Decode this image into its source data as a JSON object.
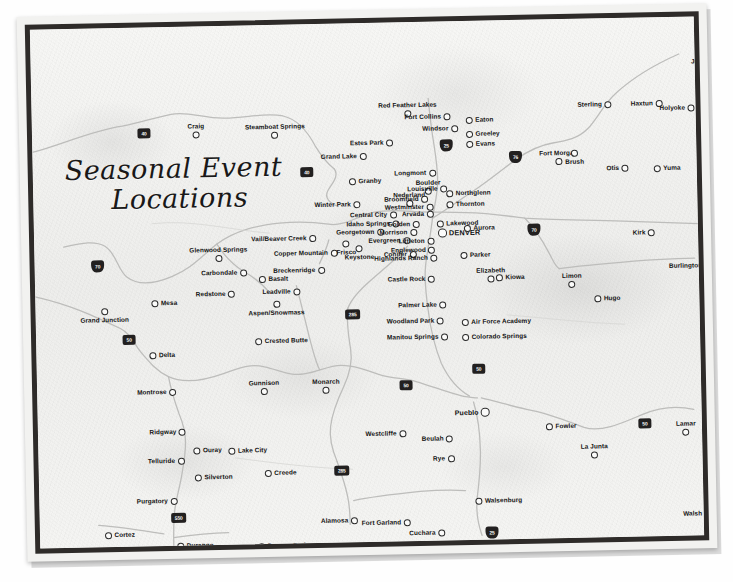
{
  "map": {
    "title_line1": "Seasonal Event",
    "title_line2": "Locations",
    "region": "Colorado",
    "colors": {
      "frame": "#2e2b29",
      "paper": "#f4f4f2",
      "road": "#b8b8b6",
      "marker_outline": "#2b2b2b",
      "label": "#121212",
      "shield": "#222020"
    },
    "cities": [
      {
        "name": "Craig",
        "x": 164,
        "y": 97,
        "anchor": "above"
      },
      {
        "name": "Steamboat Springs",
        "x": 243,
        "y": 99,
        "anchor": "above"
      },
      {
        "name": "Red Feather Lakes",
        "x": 376,
        "y": 80,
        "anchor": "above"
      },
      {
        "name": "Fort Collins",
        "x": 419,
        "y": 92,
        "anchor": "rl"
      },
      {
        "name": "Windsor",
        "x": 426,
        "y": 104,
        "anchor": "rl"
      },
      {
        "name": "Eaton",
        "x": 434,
        "y": 96,
        "anchor": "lr"
      },
      {
        "name": "Greeley",
        "x": 434,
        "y": 110,
        "anchor": "lr"
      },
      {
        "name": "Evans",
        "x": 434,
        "y": 120,
        "anchor": "lr"
      },
      {
        "name": "Fort Morgan",
        "x": 526,
        "y": 131,
        "anchor": "above"
      },
      {
        "name": "Brush",
        "x": 542,
        "y": 131,
        "anchor": "below"
      },
      {
        "name": "Sterling",
        "x": 580,
        "y": 83,
        "anchor": "rl"
      },
      {
        "name": "Julesburg",
        "x": 676,
        "y": 42,
        "anchor": "above"
      },
      {
        "name": "Haxtun",
        "x": 631,
        "y": 83,
        "anchor": "rl"
      },
      {
        "name": "Holyoke",
        "x": 663,
        "y": 88,
        "anchor": "rl"
      },
      {
        "name": "Otis",
        "x": 596,
        "y": 147,
        "anchor": "rl"
      },
      {
        "name": "Yuma",
        "x": 621,
        "y": 148,
        "anchor": "lr"
      },
      {
        "name": "Estes Park",
        "x": 361,
        "y": 117,
        "anchor": "rl"
      },
      {
        "name": "Grand Lake",
        "x": 334,
        "y": 130,
        "anchor": "rl"
      },
      {
        "name": "Granby",
        "x": 316,
        "y": 155,
        "anchor": "lr"
      },
      {
        "name": "Longmont",
        "x": 403,
        "y": 148,
        "anchor": "rl"
      },
      {
        "name": "Boulder",
        "x": 395,
        "y": 158,
        "anchor": "above"
      },
      {
        "name": "Louisville",
        "x": 414,
        "y": 164,
        "anchor": "rl"
      },
      {
        "name": "Nederland",
        "x": 376,
        "y": 170,
        "anchor": "above"
      },
      {
        "name": "Northglenn",
        "x": 413,
        "y": 169,
        "anchor": "lr"
      },
      {
        "name": "Broomfield",
        "x": 395,
        "y": 174,
        "anchor": "rl"
      },
      {
        "name": "Thornton",
        "x": 413,
        "y": 180,
        "anchor": "lr"
      },
      {
        "name": "Westminster",
        "x": 400,
        "y": 182,
        "anchor": "rl"
      },
      {
        "name": "Arvada",
        "x": 400,
        "y": 189,
        "anchor": "rl"
      },
      {
        "name": "Winter Park",
        "x": 327,
        "y": 178,
        "anchor": "rl"
      },
      {
        "name": "Central City",
        "x": 363,
        "y": 189,
        "anchor": "rl"
      },
      {
        "name": "Idaho Springs",
        "x": 366,
        "y": 198,
        "anchor": "rl"
      },
      {
        "name": "Golden",
        "x": 386,
        "y": 199,
        "anchor": "rl"
      },
      {
        "name": "Lakewood",
        "x": 403,
        "y": 199,
        "anchor": "lr"
      },
      {
        "name": "DENVER",
        "x": 404,
        "y": 207,
        "anchor": "lr",
        "class": "capital"
      },
      {
        "name": "Aurora",
        "x": 430,
        "y": 204,
        "anchor": "lr"
      },
      {
        "name": "Georgetown",
        "x": 350,
        "y": 206,
        "anchor": "rl"
      },
      {
        "name": "Morrison",
        "x": 383,
        "y": 207,
        "anchor": "rl"
      },
      {
        "name": "Evergreen",
        "x": 376,
        "y": 215,
        "anchor": "rl"
      },
      {
        "name": "Littleton",
        "x": 400,
        "y": 216,
        "anchor": "rl"
      },
      {
        "name": "Englewood",
        "x": 401,
        "y": 225,
        "anchor": "rl"
      },
      {
        "name": "Conifer",
        "x": 382,
        "y": 229,
        "anchor": "rl"
      },
      {
        "name": "Highlands Ranch",
        "x": 403,
        "y": 233,
        "anchor": "rl"
      },
      {
        "name": "Parker",
        "x": 426,
        "y": 231,
        "anchor": "lr"
      },
      {
        "name": "Castle Rock",
        "x": 400,
        "y": 254,
        "anchor": "rl"
      },
      {
        "name": "Elizabeth",
        "x": 456,
        "y": 247,
        "anchor": "above"
      },
      {
        "name": "Kiowa",
        "x": 461,
        "y": 254,
        "anchor": "lr"
      },
      {
        "name": "Limon",
        "x": 537,
        "y": 254,
        "anchor": "above"
      },
      {
        "name": "Hugo",
        "x": 559,
        "y": 277,
        "anchor": "lr"
      },
      {
        "name": "Burlington",
        "x": 677,
        "y": 246,
        "anchor": "rl"
      },
      {
        "name": "Kirk",
        "x": 621,
        "y": 212,
        "anchor": "rl"
      },
      {
        "name": "Glenwood Springs",
        "x": 184,
        "y": 221,
        "anchor": "above"
      },
      {
        "name": "Vail/Beaver Creek",
        "x": 282,
        "y": 211,
        "anchor": "rl"
      },
      {
        "name": "Copper Mountain",
        "x": 303,
        "y": 226,
        "anchor": "rl"
      },
      {
        "name": "Frisco",
        "x": 312,
        "y": 217,
        "anchor": "below"
      },
      {
        "name": "Keystone",
        "x": 325,
        "y": 222,
        "anchor": "below"
      },
      {
        "name": "Breckenridge",
        "x": 290,
        "y": 243,
        "anchor": "rl"
      },
      {
        "name": "Carbondale",
        "x": 212,
        "y": 244,
        "anchor": "rl"
      },
      {
        "name": "Basalt",
        "x": 224,
        "y": 251,
        "anchor": "lr"
      },
      {
        "name": "Redstone",
        "x": 200,
        "y": 265,
        "anchor": "rl"
      },
      {
        "name": "Aspen/Snowmass",
        "x": 241,
        "y": 276,
        "anchor": "below"
      },
      {
        "name": "Leadville",
        "x": 265,
        "y": 264,
        "anchor": "rl"
      },
      {
        "name": "Mesa",
        "x": 116,
        "y": 273,
        "anchor": "lr"
      },
      {
        "name": "Grand Junction",
        "x": 69,
        "y": 280,
        "anchor": "below"
      },
      {
        "name": "Delta",
        "x": 113,
        "y": 325,
        "anchor": "lr"
      },
      {
        "name": "Crested Butte",
        "x": 219,
        "y": 313,
        "anchor": "lr"
      },
      {
        "name": "Gunnison",
        "x": 227,
        "y": 355,
        "anchor": "above"
      },
      {
        "name": "Monarch",
        "x": 289,
        "y": 355,
        "anchor": "above"
      },
      {
        "name": "Montrose",
        "x": 139,
        "y": 362,
        "anchor": "rl"
      },
      {
        "name": "Ridgway",
        "x": 148,
        "y": 402,
        "anchor": "rl"
      },
      {
        "name": "Ouray",
        "x": 155,
        "y": 421,
        "anchor": "lr"
      },
      {
        "name": "Lake City",
        "x": 190,
        "y": 422,
        "anchor": "lr"
      },
      {
        "name": "Telluride",
        "x": 146,
        "y": 431,
        "anchor": "rl"
      },
      {
        "name": "Silverton",
        "x": 156,
        "y": 448,
        "anchor": "lr"
      },
      {
        "name": "Creede",
        "x": 226,
        "y": 445,
        "anchor": "lr"
      },
      {
        "name": "Purgatory",
        "x": 138,
        "y": 471,
        "anchor": "rl"
      },
      {
        "name": "Cortez",
        "x": 65,
        "y": 504,
        "anchor": "lr"
      },
      {
        "name": "Durango",
        "x": 137,
        "y": 516,
        "anchor": "lr"
      },
      {
        "name": "Pagosa Springs",
        "x": 218,
        "y": 518,
        "anchor": "lr"
      },
      {
        "name": "Palmer Lake",
        "x": 411,
        "y": 280,
        "anchor": "rl"
      },
      {
        "name": "Woodland Park",
        "x": 408,
        "y": 296,
        "anchor": "rl"
      },
      {
        "name": "Air Force Academy",
        "x": 426,
        "y": 298,
        "anchor": "lr"
      },
      {
        "name": "Manitou Springs",
        "x": 412,
        "y": 312,
        "anchor": "rl"
      },
      {
        "name": "Colorado Springs",
        "x": 426,
        "y": 313,
        "anchor": "lr"
      },
      {
        "name": "Pueblo",
        "x": 452,
        "y": 387,
        "anchor": "rl",
        "class": "major"
      },
      {
        "name": "Westcliffe",
        "x": 368,
        "y": 408,
        "anchor": "rl"
      },
      {
        "name": "Beulah",
        "x": 415,
        "y": 414,
        "anchor": "rl"
      },
      {
        "name": "Rye",
        "x": 416,
        "y": 434,
        "anchor": "rl"
      },
      {
        "name": "Fowler",
        "x": 508,
        "y": 404,
        "anchor": "lr"
      },
      {
        "name": "La Junta",
        "x": 556,
        "y": 425,
        "anchor": "above"
      },
      {
        "name": "Lamar",
        "x": 648,
        "y": 404,
        "anchor": "above"
      },
      {
        "name": "Holly",
        "x": 686,
        "y": 409,
        "anchor": "above"
      },
      {
        "name": "Walsh",
        "x": 672,
        "y": 494,
        "anchor": "rl"
      },
      {
        "name": "Walsenburg",
        "x": 436,
        "y": 477,
        "anchor": "lr"
      },
      {
        "name": "Alamosa",
        "x": 318,
        "y": 494,
        "anchor": "rl"
      },
      {
        "name": "Fort Garland",
        "x": 371,
        "y": 497,
        "anchor": "rl"
      },
      {
        "name": "Cuchara",
        "x": 405,
        "y": 508,
        "anchor": "rl"
      },
      {
        "name": "San Luis",
        "x": 371,
        "y": 527,
        "anchor": "rl"
      },
      {
        "name": "Trinidad",
        "x": 464,
        "y": 535,
        "anchor": "lr"
      }
    ],
    "shields": [
      {
        "route": "40",
        "type": "us",
        "x": 112,
        "y": 106
      },
      {
        "route": "40",
        "type": "us",
        "x": 274,
        "y": 148
      },
      {
        "route": "25",
        "type": "interstate",
        "x": 414,
        "y": 124
      },
      {
        "route": "76",
        "type": "interstate",
        "x": 483,
        "y": 137
      },
      {
        "route": "70",
        "type": "interstate",
        "x": 63,
        "y": 238
      },
      {
        "route": "70",
        "type": "interstate",
        "x": 500,
        "y": 210
      },
      {
        "route": "50",
        "type": "us",
        "x": 93,
        "y": 312
      },
      {
        "route": "285",
        "type": "us",
        "x": 317,
        "y": 291
      },
      {
        "route": "50",
        "type": "us",
        "x": 369,
        "y": 363
      },
      {
        "route": "50",
        "type": "us",
        "x": 442,
        "y": 348
      },
      {
        "route": "285",
        "type": "us",
        "x": 303,
        "y": 447
      },
      {
        "route": "550",
        "type": "us",
        "x": 139,
        "y": 491
      },
      {
        "route": "50",
        "type": "us",
        "x": 607,
        "y": 406
      },
      {
        "route": "25",
        "type": "interstate",
        "x": 452,
        "y": 512
      }
    ]
  }
}
